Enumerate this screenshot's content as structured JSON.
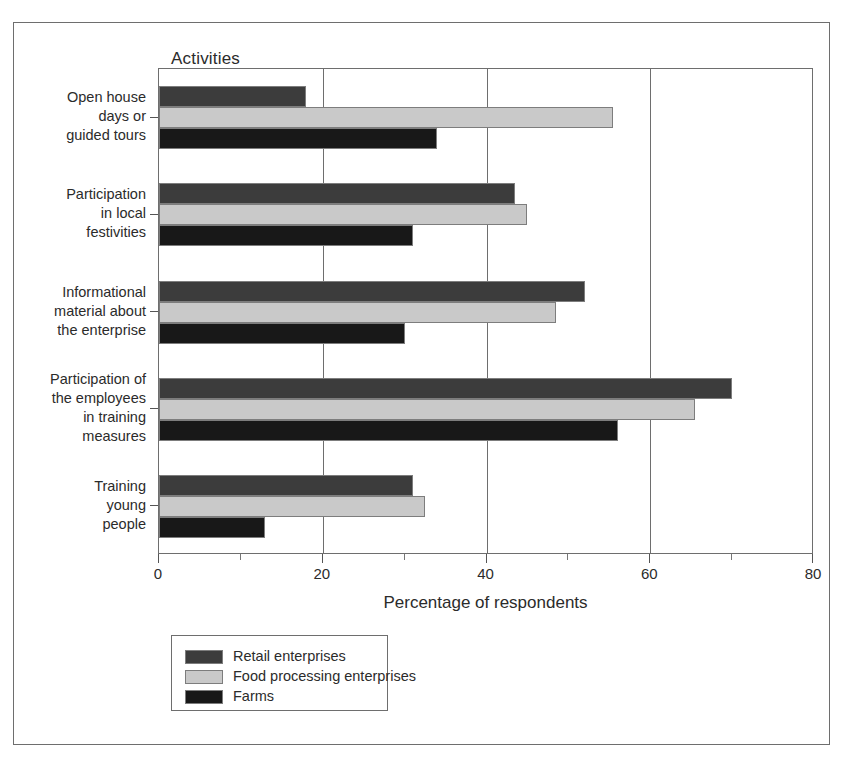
{
  "chart_data": {
    "type": "bar",
    "orientation": "horizontal",
    "title": "Activities",
    "xlabel": "Percentage of respondents",
    "ylabel": "",
    "xlim": [
      0,
      80
    ],
    "xticks": [
      0,
      20,
      40,
      60,
      80
    ],
    "xtick_labels": [
      "0",
      "20",
      "40",
      "60",
      "80"
    ],
    "xticks_minor": [
      10,
      30,
      50,
      70
    ],
    "grid": "vertical gridlines at major x ticks",
    "legend_position": "below axes, left",
    "categories": [
      "Open house\ndays or\nguided tours",
      "Participation\nin local\nfestivities",
      "Informational\nmaterial about\nthe enterprise",
      "Participation of\nthe employees\nin training\nmeasures",
      "Training\nyoung\npeople"
    ],
    "series": [
      {
        "name": "Retail enterprises",
        "color": "#3c3c3c",
        "values": [
          18,
          43.5,
          52,
          70,
          31
        ]
      },
      {
        "name": "Food processing enterprises",
        "color": "#c9c9c9",
        "values": [
          55.5,
          45,
          48.5,
          65.5,
          32.5
        ]
      },
      {
        "name": "Farms",
        "color": "#181818",
        "values": [
          34,
          31,
          30,
          56,
          13
        ]
      }
    ]
  }
}
